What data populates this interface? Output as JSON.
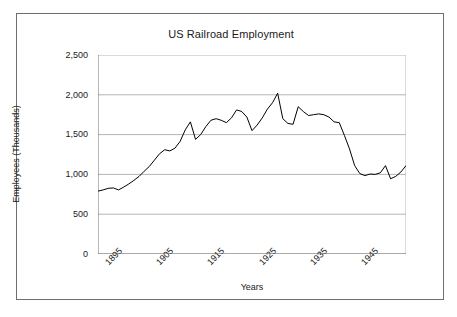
{
  "chart_data": {
    "type": "line",
    "title": "US Railroad Employment",
    "xlabel": "Years",
    "ylabel": "Employees (Thousands)",
    "xlim": [
      1890,
      1950
    ],
    "ylim": [
      0,
      2500
    ],
    "grid": true,
    "legend": "none",
    "y_ticks": [
      0,
      500,
      1000,
      1500,
      2000,
      2500
    ],
    "y_tick_labels": [
      "0",
      "500",
      "1,000",
      "1,500",
      "2,000",
      "2,500"
    ],
    "x_ticks": [
      1895,
      1905,
      1915,
      1925,
      1935,
      1945
    ],
    "x_tick_labels": [
      "1895",
      "1905",
      "1915",
      "1925",
      "1935",
      "1945"
    ],
    "x_minor_tick_interval": 1,
    "series": [
      {
        "name": "US Railroad Employment",
        "color": "#000000",
        "x": [
          1890,
          1891,
          1892,
          1893,
          1894,
          1895,
          1896,
          1897,
          1898,
          1899,
          1900,
          1901,
          1902,
          1903,
          1904,
          1905,
          1906,
          1907,
          1908,
          1909,
          1910,
          1911,
          1912,
          1913,
          1914,
          1915,
          1916,
          1917,
          1918,
          1919,
          1920,
          1921,
          1922,
          1923,
          1924,
          1925,
          1926,
          1927,
          1928,
          1929,
          1930,
          1931,
          1932,
          1933,
          1934,
          1935,
          1936,
          1937,
          1938,
          1939,
          1940,
          1941,
          1942,
          1943,
          1944,
          1945,
          1946,
          1947,
          1948,
          1949,
          1950
        ],
        "values": [
          790,
          805,
          825,
          830,
          805,
          840,
          880,
          925,
          975,
          1040,
          1100,
          1180,
          1260,
          1310,
          1295,
          1330,
          1415,
          1560,
          1660,
          1440,
          1500,
          1600,
          1680,
          1700,
          1680,
          1650,
          1710,
          1810,
          1790,
          1720,
          1550,
          1620,
          1710,
          1820,
          1900,
          2020,
          1700,
          1640,
          1630,
          1850,
          1790,
          1740,
          1750,
          1760,
          1750,
          1720,
          1660,
          1650,
          1490,
          1320,
          1110,
          1010,
          985,
          1005,
          1000,
          1020,
          1110,
          945,
          975,
          1030,
          1110
        ]
      }
    ]
  }
}
